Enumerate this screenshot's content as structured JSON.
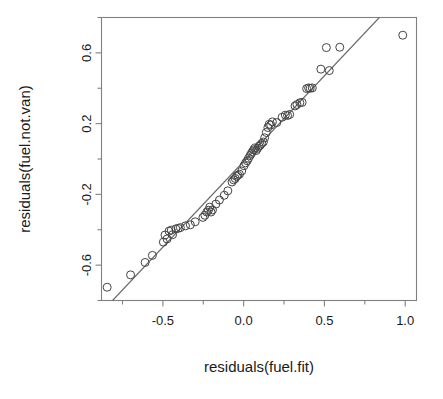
{
  "chart_data": {
    "type": "scatter",
    "title": "",
    "xlabel": "residuals(fuel.fit)",
    "ylabel": "residuals(fuel.not.van)",
    "xlim": [
      -0.88,
      1.07
    ],
    "ylim": [
      -0.8,
      0.8
    ],
    "xticks": [
      "-0.5",
      "0.0",
      "0.5",
      "1.0"
    ],
    "xtick_values": [
      -0.5,
      0.0,
      0.5,
      1.0
    ],
    "yticks": [
      "-0.6",
      "-0.2",
      "0.2",
      "0.6"
    ],
    "ytick_values": [
      -0.6,
      -0.2,
      0.2,
      0.6
    ],
    "minor_ticks": true,
    "grid": false,
    "legend": null,
    "point_marker": "open-circle",
    "point_radius_px": 4,
    "reference_line": {
      "type": "line",
      "label": "fitted line",
      "x0": -0.76,
      "y0": -0.75,
      "x1": 0.84,
      "y1": 0.8
    },
    "points": [
      [
        -0.845,
        -0.725
      ],
      [
        -0.7,
        -0.655
      ],
      [
        -0.61,
        -0.585
      ],
      [
        -0.565,
        -0.545
      ],
      [
        -0.497,
        -0.47
      ],
      [
        -0.487,
        -0.43
      ],
      [
        -0.474,
        -0.452
      ],
      [
        -0.462,
        -0.408
      ],
      [
        -0.448,
        -0.402
      ],
      [
        -0.44,
        -0.428
      ],
      [
        -0.42,
        -0.395
      ],
      [
        -0.405,
        -0.392
      ],
      [
        -0.392,
        -0.388
      ],
      [
        -0.36,
        -0.378
      ],
      [
        -0.33,
        -0.372
      ],
      [
        -0.3,
        -0.355
      ],
      [
        -0.252,
        -0.33
      ],
      [
        -0.24,
        -0.318
      ],
      [
        -0.228,
        -0.3
      ],
      [
        -0.218,
        -0.29
      ],
      [
        -0.21,
        -0.272
      ],
      [
        -0.202,
        -0.3
      ],
      [
        -0.193,
        -0.288
      ],
      [
        -0.172,
        -0.255
      ],
      [
        -0.15,
        -0.232
      ],
      [
        -0.12,
        -0.205
      ],
      [
        -0.098,
        -0.18
      ],
      [
        -0.072,
        -0.13
      ],
      [
        -0.062,
        -0.118
      ],
      [
        -0.052,
        -0.11
      ],
      [
        -0.044,
        -0.098
      ],
      [
        -0.036,
        -0.092
      ],
      [
        -0.026,
        -0.086
      ],
      [
        -0.012,
        -0.068
      ],
      [
        0.002,
        -0.038
      ],
      [
        0.012,
        -0.022
      ],
      [
        0.022,
        -0.01
      ],
      [
        0.03,
        0.004
      ],
      [
        0.04,
        0.02
      ],
      [
        0.048,
        0.032
      ],
      [
        0.055,
        0.042
      ],
      [
        0.062,
        0.052
      ],
      [
        0.07,
        0.062
      ],
      [
        0.078,
        0.048
      ],
      [
        0.086,
        0.06
      ],
      [
        0.095,
        0.072
      ],
      [
        0.103,
        0.078
      ],
      [
        0.112,
        0.088
      ],
      [
        0.122,
        0.096
      ],
      [
        0.13,
        0.12
      ],
      [
        0.14,
        0.15
      ],
      [
        0.15,
        0.178
      ],
      [
        0.158,
        0.196
      ],
      [
        0.168,
        0.192
      ],
      [
        0.178,
        0.21
      ],
      [
        0.205,
        0.206
      ],
      [
        0.238,
        0.236
      ],
      [
        0.258,
        0.248
      ],
      [
        0.272,
        0.246
      ],
      [
        0.285,
        0.252
      ],
      [
        0.318,
        0.3
      ],
      [
        0.33,
        0.308
      ],
      [
        0.348,
        0.318
      ],
      [
        0.362,
        0.32
      ],
      [
        0.39,
        0.398
      ],
      [
        0.402,
        0.402
      ],
      [
        0.412,
        0.4
      ],
      [
        0.425,
        0.402
      ],
      [
        0.478,
        0.508
      ],
      [
        0.53,
        0.5
      ],
      [
        0.512,
        0.63
      ],
      [
        0.595,
        0.632
      ],
      [
        0.985,
        0.7
      ]
    ]
  }
}
